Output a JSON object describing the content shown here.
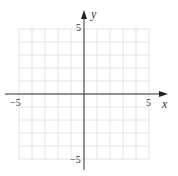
{
  "diagram": {
    "type": "coordinate-grid",
    "x_axis": {
      "label": "x",
      "min": -5,
      "max": 5,
      "tick_labels": [
        "−5",
        "5"
      ]
    },
    "y_axis": {
      "label": "y",
      "min": -5,
      "max": 5,
      "tick_labels": [
        "5",
        "−5"
      ]
    },
    "grid": {
      "step": 1,
      "color": "#e6e6e6"
    },
    "axis_color": "#333333"
  }
}
